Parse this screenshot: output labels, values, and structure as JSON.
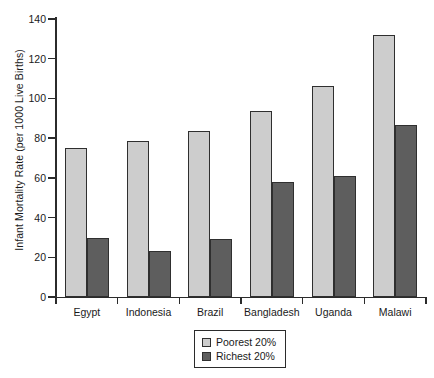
{
  "chart_data": {
    "type": "bar",
    "title": "",
    "xlabel": "",
    "ylabel": "Infant Mortality Rate (per 1000 Live Births)",
    "categories": [
      "Egypt",
      "Indonesia",
      "Brazil",
      "Bangladesh",
      "Uganda",
      "Malawi"
    ],
    "series": [
      {
        "name": "Poorest 20%",
        "color": "#cdcdcd",
        "values": [
          75,
          78.5,
          83.5,
          93.5,
          106.5,
          132
        ]
      },
      {
        "name": "Richest 20%",
        "color": "#5e5e5e",
        "values": [
          29.5,
          23,
          29,
          58,
          61,
          86.5
        ]
      }
    ],
    "ylim": [
      0,
      140
    ],
    "yticks": [
      0,
      20,
      40,
      60,
      80,
      100,
      120,
      140
    ],
    "ytick_labels": [
      "0",
      "20",
      "40",
      "60",
      "80",
      "100",
      "120",
      "140"
    ],
    "grid": false,
    "legend_position": "bottom-center",
    "legend_entries": [
      "Poorest 20%",
      "Richest 20%"
    ]
  }
}
